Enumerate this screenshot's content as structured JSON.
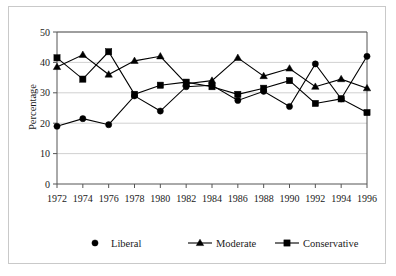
{
  "chart_data": {
    "type": "line",
    "title": "",
    "xlabel": "",
    "ylabel": "Percentage",
    "ylim": [
      0,
      50
    ],
    "yticks": [
      0,
      10,
      20,
      30,
      40,
      50
    ],
    "grid": true,
    "legend_position": "bottom",
    "categories": [
      "1972",
      "1974",
      "1976",
      "1978",
      "1980",
      "1982",
      "1984",
      "1986",
      "1988",
      "1990",
      "1992",
      "1994",
      "1996"
    ],
    "series": [
      {
        "name": "Liberal",
        "marker": "circle",
        "color": "#000000",
        "values": [
          19.0,
          21.5,
          19.5,
          29.0,
          24.0,
          32.0,
          32.5,
          27.5,
          30.5,
          25.5,
          39.5,
          28.0,
          42.0
        ]
      },
      {
        "name": "Moderate",
        "marker": "triangle",
        "color": "#000000",
        "values": [
          38.5,
          42.5,
          36.0,
          40.5,
          42.0,
          33.0,
          34.0,
          41.5,
          35.5,
          38.0,
          32.0,
          34.5,
          31.5
        ]
      },
      {
        "name": "Conservative",
        "marker": "square",
        "color": "#000000",
        "values": [
          41.5,
          34.5,
          43.5,
          29.5,
          32.5,
          33.5,
          32.0,
          29.5,
          31.5,
          34.0,
          26.5,
          28.0,
          23.5
        ]
      }
    ]
  },
  "axis": {
    "y_label": "Percentage",
    "y_tick_labels": [
      "0",
      "10",
      "20",
      "30",
      "40",
      "50"
    ],
    "x_tick_labels": [
      "1972",
      "1974",
      "1976",
      "1978",
      "1980",
      "1982",
      "1984",
      "1986",
      "1988",
      "1990",
      "1992",
      "1994",
      "1996"
    ]
  },
  "legend": {
    "items": [
      {
        "label": "Liberal",
        "marker": "circle-marker"
      },
      {
        "label": "Moderate",
        "marker": "triangle-marker"
      },
      {
        "label": "Conservative",
        "marker": "square-marker"
      }
    ]
  },
  "colors": {
    "ink": "#000000",
    "grid": "#bdbdbd",
    "axis": "#555555",
    "frame": "#c9c9c9",
    "background": "#ffffff"
  }
}
